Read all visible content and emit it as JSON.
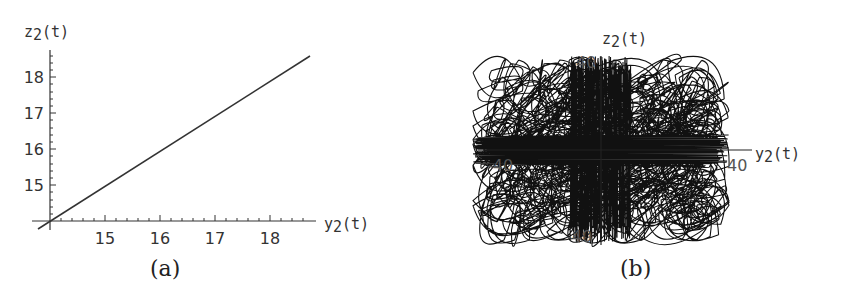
{
  "chart_data": [
    {
      "panel": "a",
      "type": "line",
      "caption": "(a)",
      "xlabel": "y2(t)",
      "ylabel": "z2(t)",
      "x_ticks": [
        15,
        16,
        17,
        18
      ],
      "y_ticks": [
        15,
        16,
        17,
        18
      ],
      "axis_origin": [
        14,
        14
      ],
      "xlim": [
        14,
        18.8
      ],
      "ylim": [
        14,
        18.8
      ],
      "series": [
        {
          "name": "z2 vs y2",
          "x": [
            13.8,
            18.8
          ],
          "y": [
            13.8,
            18.7
          ]
        }
      ],
      "grid": false,
      "legend": null
    },
    {
      "panel": "b",
      "type": "line",
      "caption": "(b)",
      "xlabel": "y2(t)",
      "ylabel": "z2(t)",
      "x_ticks": [
        -40,
        40
      ],
      "y_ticks": [
        40,
        -40
      ],
      "axis_origin": [
        0,
        0
      ],
      "xlim": [
        -45,
        45
      ],
      "ylim": [
        -45,
        45
      ],
      "description": "Dense chaotic phase-space trajectory filling a roughly rectangular region about y2 in [-45,45], z2 in [-40,40]",
      "grid": false,
      "legend": null
    }
  ],
  "labels": {
    "a": {
      "ylabel_main": "z",
      "ylabel_sub": "2",
      "ylabel_tail": "(t)",
      "xlabel_main": "y",
      "xlabel_sub": "2",
      "xlabel_tail": "(t)",
      "xticks": [
        "15",
        "16",
        "17",
        "18"
      ],
      "yticks": [
        "15",
        "16",
        "17",
        "18"
      ],
      "caption": "(a)"
    },
    "b": {
      "ylabel_main": "z",
      "ylabel_sub": "2",
      "ylabel_tail": "(t)",
      "xlabel_main": "y",
      "xlabel_sub": "2",
      "xlabel_tail": "(t)",
      "xtick_neg": "-40",
      "xtick_pos": "40",
      "ytick_pos": "40",
      "ytick_neg": "-40",
      "caption": "(b)"
    }
  }
}
